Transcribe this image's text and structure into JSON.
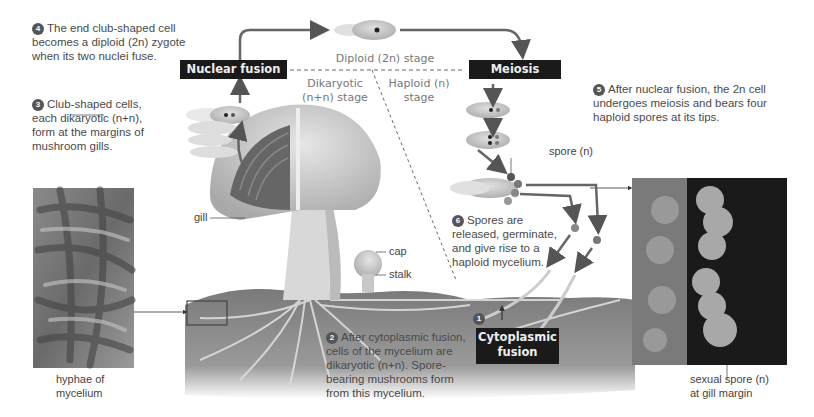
{
  "steps": [
    {
      "num": "1",
      "text": ""
    },
    {
      "num": "2",
      "text": "After cytoplasmic fusion, cells of the mycelium are dikaryotic (n+n). Spore-bearing mushrooms form from this mycelium.",
      "lines": [
        "After cytoplasmic fusion,",
        "cells of the mycelium are",
        "dikaryotic (n+n). Spore-",
        "bearing mushrooms form",
        "from this mycelium."
      ]
    },
    {
      "num": "3",
      "lines": [
        "Club-shaped cells,",
        "each dikaryotic (n+n),",
        "form at the margins of",
        "mushroom gills."
      ]
    },
    {
      "num": "4",
      "lines": [
        "The end club-shaped cell",
        "becomes a diploid (2n) zygote",
        "when its two nuclei fuse."
      ]
    },
    {
      "num": "5",
      "lines": [
        "After nuclear fusion, the 2n cell",
        "undergoes meiosis and bears four",
        "haploid spores at its tips."
      ]
    },
    {
      "num": "6",
      "lines": [
        "Spores are",
        "released, germinate,",
        "and give rise to a",
        "haploid mycelium."
      ]
    }
  ],
  "stage_boxes": {
    "nuclear_fusion": "Nuclear fusion",
    "meiosis": "Meiosis",
    "cytoplasmic_fusion_line1": "Cytoplasmic",
    "cytoplasmic_fusion_line2": "fusion"
  },
  "stage_labels": {
    "diploid": "Diploid (2n) stage",
    "dikaryotic_line1": "Dikaryotic",
    "dikaryotic_line2": "(n+n) stage",
    "haploid_line1": "Haploid (n)",
    "haploid_line2": "stage"
  },
  "structure_labels": {
    "gill": "gill",
    "cap": "cap",
    "stalk": "stalk",
    "spore": "spore (n)"
  },
  "photo_captions": {
    "left_line1": "hyphae of",
    "left_line2": "mycelium",
    "right_line1": "sexual spore (n)",
    "right_line2": "at gill margin"
  },
  "colors": {
    "stage_box": "#1a1a1a",
    "arrow": "#555555",
    "soil": "#8a8a8a",
    "caption_text": "#4a4a4a"
  }
}
